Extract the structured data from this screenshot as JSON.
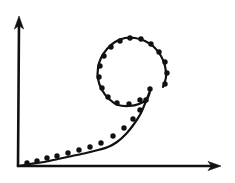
{
  "figure": {
    "title": "",
    "background_color": "#ffffff",
    "ink_color": "#111111",
    "style": "hand-drawn sketch",
    "width": 235,
    "height": 183
  },
  "axes": {
    "origin": {
      "x": 18,
      "y": 166
    },
    "x_axis": {
      "name": "x-axis",
      "label": "",
      "from": {
        "x": 18,
        "y": 166
      },
      "to": {
        "x": 221,
        "y": 166
      },
      "arrow": "right",
      "ticks": [],
      "tick_labels": []
    },
    "y_axis": {
      "name": "y-axis",
      "label": "",
      "from": {
        "x": 18,
        "y": 166
      },
      "to": {
        "x": 19,
        "y": 16
      },
      "arrow": "up",
      "ticks": [],
      "tick_labels": []
    }
  },
  "chart_data": {
    "type": "scatter",
    "title": "",
    "subtitle": "",
    "xlabel": "",
    "ylabel": "",
    "xlim": [
      18,
      221
    ],
    "ylim": [
      166,
      16
    ],
    "grid": false,
    "legend": null,
    "legend_position": "none",
    "annotations": [],
    "axis_arrows": {
      "x": true,
      "y": true
    },
    "series": [
      {
        "name": "data-points",
        "marker": "filled-circle",
        "marker_radius": 2.7,
        "color": "#111111",
        "points": [
          [
            27,
            163
          ],
          [
            37,
            161
          ],
          [
            47,
            158
          ],
          [
            57,
            156
          ],
          [
            68,
            153
          ],
          [
            79,
            150
          ],
          [
            90,
            147
          ],
          [
            101,
            143
          ],
          [
            113,
            136
          ],
          [
            124,
            128
          ],
          [
            133,
            119
          ],
          [
            140,
            110
          ],
          [
            146,
            100
          ],
          [
            150,
            89
          ],
          [
            140,
            100
          ],
          [
            129,
            104
          ],
          [
            117,
            103
          ],
          [
            108,
            97
          ],
          [
            102,
            88
          ],
          [
            99,
            77
          ],
          [
            100,
            66
          ],
          [
            104,
            56
          ],
          [
            111,
            47
          ],
          [
            120,
            41
          ],
          [
            130,
            38
          ],
          [
            141,
            39
          ],
          [
            151,
            44
          ],
          [
            159,
            52
          ],
          [
            165,
            62
          ],
          [
            167,
            73
          ],
          [
            165,
            84
          ]
        ]
      },
      {
        "name": "fitted-spiral-curve",
        "type": "line",
        "color": "#111111",
        "stroke_width": 2.2,
        "path_points": [
          [
            19,
            166
          ],
          [
            30,
            164
          ],
          [
            44,
            162
          ],
          [
            58,
            159
          ],
          [
            72,
            156
          ],
          [
            86,
            153
          ],
          [
            98,
            150
          ],
          [
            108,
            147
          ],
          [
            117,
            142
          ],
          [
            126,
            134
          ],
          [
            134,
            124
          ],
          [
            141,
            113
          ],
          [
            146,
            101
          ],
          [
            150,
            91
          ],
          [
            147,
            99
          ],
          [
            139,
            104
          ],
          [
            129,
            106
          ],
          [
            118,
            105
          ],
          [
            109,
            99
          ],
          [
            102,
            90
          ],
          [
            98,
            79
          ],
          [
            98,
            68
          ],
          [
            101,
            58
          ],
          [
            107,
            49
          ],
          [
            115,
            42
          ],
          [
            125,
            38
          ],
          [
            135,
            38
          ],
          [
            145,
            41
          ],
          [
            154,
            47
          ],
          [
            161,
            56
          ],
          [
            165,
            66
          ],
          [
            166,
            77
          ],
          [
            163,
            87
          ]
        ]
      }
    ]
  }
}
